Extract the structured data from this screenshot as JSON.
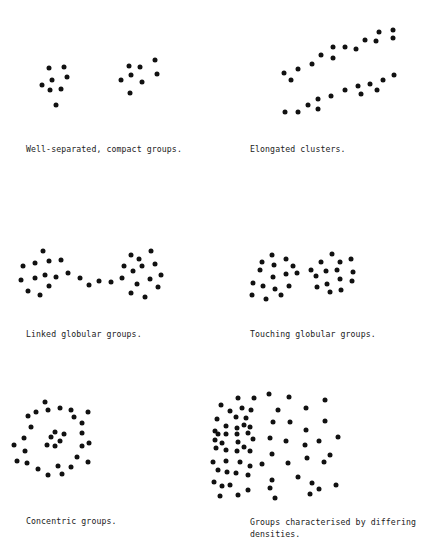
{
  "figure": {
    "panels": [
      {
        "id": "well-separated",
        "caption": "Well-separated, compact groups.",
        "caption_pos": [
          26,
          143
        ],
        "dots": [
          [
            48.7,
            68.3
          ],
          [
            64,
            67.3
          ],
          [
            67,
            77.3
          ],
          [
            52.3,
            79.7
          ],
          [
            42.3,
            85.3
          ],
          [
            50,
            90
          ],
          [
            60.7,
            89
          ],
          [
            56,
            105
          ],
          [
            128.7,
            66
          ],
          [
            140,
            67
          ],
          [
            155.3,
            60.3
          ],
          [
            157.3,
            73.7
          ],
          [
            131.3,
            75
          ],
          [
            121,
            80
          ],
          [
            142.3,
            82.3
          ],
          [
            130,
            92.7
          ]
        ]
      },
      {
        "id": "elongated",
        "caption": "Elongated clusters.",
        "caption_pos": [
          250,
          143
        ],
        "dots": [
          [
            283.7,
            72.7
          ],
          [
            290.7,
            79.7
          ],
          [
            298.3,
            69
          ],
          [
            312,
            64
          ],
          [
            320.7,
            55
          ],
          [
            332.7,
            47.3
          ],
          [
            333.3,
            57.7
          ],
          [
            344.7,
            46.7
          ],
          [
            355.7,
            49
          ],
          [
            364.7,
            40.3
          ],
          [
            376,
            41
          ],
          [
            379,
            31.7
          ],
          [
            393,
            30
          ],
          [
            392.7,
            37.7
          ],
          [
            284.7,
            112.3
          ],
          [
            298.3,
            112
          ],
          [
            307.7,
            105.3
          ],
          [
            318,
            99.3
          ],
          [
            318,
            109
          ],
          [
            331.3,
            96.3
          ],
          [
            345,
            89.7
          ],
          [
            358,
            86
          ],
          [
            361,
            94.3
          ],
          [
            370.3,
            83.7
          ],
          [
            377,
            90.3
          ],
          [
            383.3,
            80
          ],
          [
            394,
            75.3
          ]
        ]
      },
      {
        "id": "linked",
        "caption": "Linked globular groups.",
        "caption_pos": [
          26,
          328
        ],
        "dots": [
          [
            43,
            251
          ],
          [
            22.7,
            266
          ],
          [
            35,
            263.3
          ],
          [
            49,
            261
          ],
          [
            61,
            260
          ],
          [
            21,
            279.7
          ],
          [
            35.3,
            278.3
          ],
          [
            45,
            275
          ],
          [
            56.3,
            277.3
          ],
          [
            49.3,
            285.7
          ],
          [
            68,
            273.3
          ],
          [
            28.3,
            291.3
          ],
          [
            40.3,
            294.7
          ],
          [
            79.7,
            278
          ],
          [
            89.3,
            285
          ],
          [
            99.3,
            281.3
          ],
          [
            111,
            281.7
          ],
          [
            122.3,
            278.3
          ],
          [
            130.7,
            255.3
          ],
          [
            139,
            259
          ],
          [
            150.7,
            251
          ],
          [
            124.3,
            265.7
          ],
          [
            133.3,
            270.7
          ],
          [
            142,
            265.7
          ],
          [
            154.7,
            264
          ],
          [
            136.7,
            283.7
          ],
          [
            150.3,
            279.3
          ],
          [
            161,
            275.3
          ],
          [
            158.3,
            287.3
          ],
          [
            130.7,
            292.7
          ],
          [
            145,
            296.7
          ]
        ]
      },
      {
        "id": "touching",
        "caption": "Touching globular groups.",
        "caption_pos": [
          250,
          328
        ],
        "dots": [
          [
            272,
            255
          ],
          [
            261.7,
            261.7
          ],
          [
            285.7,
            259
          ],
          [
            274,
            265
          ],
          [
            260,
            270
          ],
          [
            292.7,
            266.3
          ],
          [
            285.7,
            274
          ],
          [
            297.3,
            272.7
          ],
          [
            273.3,
            276.7
          ],
          [
            252.7,
            283.3
          ],
          [
            262.7,
            286
          ],
          [
            274.7,
            288.7
          ],
          [
            288.7,
            286.3
          ],
          [
            252,
            295
          ],
          [
            266,
            298.7
          ],
          [
            280.7,
            295.3
          ],
          [
            332.3,
            254.3
          ],
          [
            321,
            261.7
          ],
          [
            340.3,
            262
          ],
          [
            350.7,
            259.3
          ],
          [
            310.7,
            270
          ],
          [
            326,
            270.7
          ],
          [
            336.7,
            269.7
          ],
          [
            353,
            272
          ],
          [
            316,
            276
          ],
          [
            340.3,
            279.3
          ],
          [
            352,
            281.3
          ],
          [
            327.3,
            284
          ],
          [
            317.3,
            287
          ],
          [
            341.3,
            289.7
          ],
          [
            330,
            292
          ]
        ]
      },
      {
        "id": "concentric",
        "caption": "Concentric groups.",
        "caption_pos": [
          26,
          515
        ],
        "dots": [
          [
            45.3,
            402.3
          ],
          [
            36,
            411.7
          ],
          [
            47.7,
            410.3
          ],
          [
            60.3,
            407.7
          ],
          [
            70.7,
            409.7
          ],
          [
            87.7,
            412.3
          ],
          [
            28,
            416
          ],
          [
            74,
            416.7
          ],
          [
            30.7,
            427.3
          ],
          [
            81.7,
            423
          ],
          [
            55,
            431.7
          ],
          [
            51,
            437.3
          ],
          [
            64,
            434
          ],
          [
            59.7,
            440.7
          ],
          [
            47.3,
            445
          ],
          [
            55,
            446
          ],
          [
            24,
            437.7
          ],
          [
            82,
            433
          ],
          [
            14,
            445
          ],
          [
            82,
            445.7
          ],
          [
            89.3,
            442.7
          ],
          [
            25,
            451.3
          ],
          [
            77.3,
            457
          ],
          [
            17,
            461
          ],
          [
            27.3,
            463.3
          ],
          [
            87.7,
            461.7
          ],
          [
            38.3,
            469.3
          ],
          [
            58.3,
            466.3
          ],
          [
            70.7,
            466.7
          ],
          [
            48.3,
            475
          ],
          [
            61.7,
            473.7
          ]
        ]
      },
      {
        "id": "differing-densities",
        "caption": "Groups characterised by differing\ndensities.",
        "caption_pos": [
          250,
          516
        ],
        "dots": [
          [
            221,
            405
          ],
          [
            238,
            398
          ],
          [
            253.7,
            398.3
          ],
          [
            269,
            394.3
          ],
          [
            289,
            397.3
          ],
          [
            324.7,
            400
          ],
          [
            230,
            411
          ],
          [
            242,
            408
          ],
          [
            251,
            410
          ],
          [
            277.7,
            409.7
          ],
          [
            306,
            407.7
          ],
          [
            217,
            419
          ],
          [
            236,
            417
          ],
          [
            246,
            418
          ],
          [
            272.7,
            422
          ],
          [
            290,
            421.7
          ],
          [
            324.7,
            421
          ],
          [
            215,
            431
          ],
          [
            226,
            426
          ],
          [
            236.7,
            428.3
          ],
          [
            243.7,
            424.7
          ],
          [
            250,
            427.3
          ],
          [
            306,
            430
          ],
          [
            218,
            434
          ],
          [
            226,
            434.3
          ],
          [
            237,
            434
          ],
          [
            248,
            433
          ],
          [
            270,
            437.7
          ],
          [
            286,
            441.3
          ],
          [
            319,
            440.7
          ],
          [
            338,
            436.7
          ],
          [
            215,
            440
          ],
          [
            238,
            441.7
          ],
          [
            253,
            439
          ],
          [
            222,
            443
          ],
          [
            244,
            447.3
          ],
          [
            305,
            445.3
          ],
          [
            216,
            448
          ],
          [
            226,
            450
          ],
          [
            237,
            451
          ],
          [
            250,
            450.7
          ],
          [
            272,
            454
          ],
          [
            307,
            457.7
          ],
          [
            330,
            455
          ],
          [
            213,
            462
          ],
          [
            226,
            461
          ],
          [
            240,
            462.3
          ],
          [
            250,
            466
          ],
          [
            262,
            464.3
          ],
          [
            287.7,
            463.3
          ],
          [
            324,
            461.7
          ],
          [
            218,
            470
          ],
          [
            227,
            472
          ],
          [
            236,
            473
          ],
          [
            248,
            475
          ],
          [
            272,
            479.7
          ],
          [
            298,
            477.3
          ],
          [
            312,
            483.3
          ],
          [
            336,
            484.7
          ],
          [
            214,
            482
          ],
          [
            222,
            486
          ],
          [
            230,
            485.3
          ],
          [
            248,
            489.7
          ],
          [
            270,
            488
          ],
          [
            319,
            489.3
          ],
          [
            220,
            496
          ],
          [
            237.7,
            495
          ],
          [
            275,
            497.7
          ],
          [
            310,
            493.7
          ]
        ]
      }
    ],
    "dot_color": "#111111",
    "caption_color": "#222222",
    "background": "#ffffff"
  }
}
